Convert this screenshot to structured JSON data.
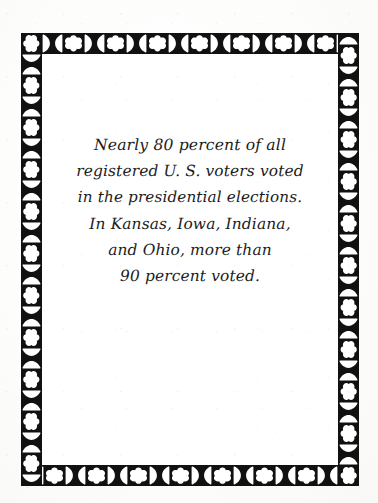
{
  "document": {
    "type": "ornamental-text-card",
    "background_color": "#ffffff",
    "ink_color": "#1b1b1b"
  },
  "frame": {
    "name": "ornamental-border",
    "band_color": "#111111",
    "motif_color": "#ffffff",
    "motifs": [
      "quatrefoil-cross",
      "bowtie-hourglass"
    ],
    "description": "Black band with alternating white quatrefoil-cross and white bowtie/hourglass motifs, repeated on all four sides"
  },
  "quote": {
    "lines": [
      "Nearly 80 percent of all",
      "registered U. S. voters voted",
      "in the presidential elections.",
      "In Kansas, Iowa, Indiana,",
      "and Ohio, more than",
      "90 percent voted."
    ],
    "full_text": "Nearly 80 percent of all registered U. S. voters voted in the presidential elections. In Kansas, Iowa, Indiana, and Ohio, more than 90 percent voted."
  }
}
